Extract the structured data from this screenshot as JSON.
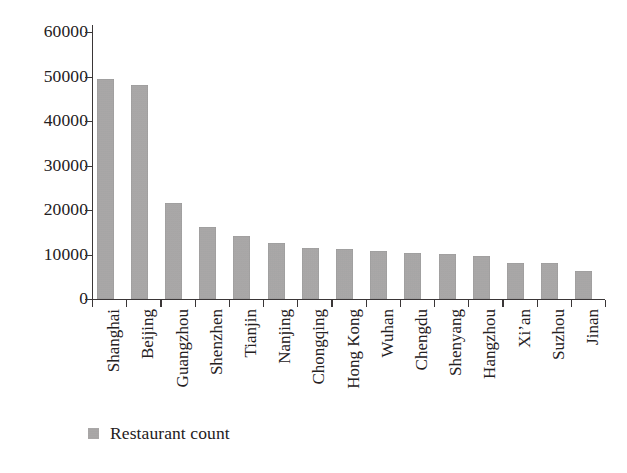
{
  "chart_data": {
    "type": "bar",
    "title": "",
    "subtitle": "",
    "xlabel": "",
    "ylabel": "",
    "categories": [
      "Shanghai",
      "Beijing",
      "Guangzhou",
      "Shenzhen",
      "Tianjin",
      "Nanjing",
      "Chongqing",
      "Hong Kong",
      "Wuhan",
      "Chengdu",
      "Shenyang",
      "Hangzhou",
      "Xi’an",
      "Suzhou",
      "Jinan"
    ],
    "values": [
      49500,
      48000,
      21500,
      16200,
      14100,
      12600,
      11400,
      11300,
      10900,
      10400,
      10100,
      9700,
      8200,
      8000,
      6300
    ],
    "series": [
      {
        "name": "Restaurant count",
        "values": [
          49500,
          48000,
          21500,
          16200,
          14100,
          12600,
          11400,
          11300,
          10900,
          10400,
          10100,
          9700,
          8200,
          8000,
          6300
        ],
        "color": "#a8a6a6"
      }
    ],
    "ylim": [
      0,
      60000
    ],
    "y_ticks": [
      0,
      10000,
      20000,
      30000,
      40000,
      50000,
      60000
    ],
    "y_tick_labels": [
      "0",
      "10000",
      "20000",
      "30000",
      "40000",
      "50000",
      "60000"
    ],
    "grid": false,
    "legend_position": "bottom-left",
    "x_tick_label_rotation": 90
  },
  "legend": {
    "entries": [
      {
        "label": "Restaurant count",
        "color": "#a8a6a6",
        "marker": "square-swatch"
      }
    ]
  },
  "colors": {
    "bar": "#a8a6a6",
    "axis": "#3a3637",
    "text": "#242021",
    "background": "#ffffff"
  }
}
